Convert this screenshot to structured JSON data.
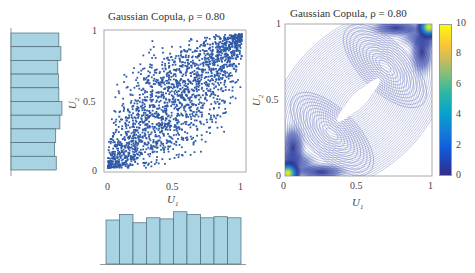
{
  "chart_data": [
    {
      "type": "scatter",
      "title": "Gaussian Copula, ρ = 0.80",
      "xlabel": "U1",
      "ylabel": "U2",
      "xlim": [
        0,
        1
      ],
      "ylim": [
        0,
        1
      ],
      "xticks": [
        "0",
        "0.5",
        "1"
      ],
      "yticks": [
        "0",
        "0.5",
        "1"
      ],
      "rho": 0.8,
      "n_points_approx": 2000,
      "point_color": "#2e5aa8",
      "grid": false
    },
    {
      "type": "heatmap",
      "subtype": "contour-density",
      "title": "Gaussian Copula, ρ = 0.80",
      "xlabel": "U1",
      "ylabel": "U2",
      "xlim": [
        0,
        1
      ],
      "ylim": [
        0,
        1
      ],
      "xticks": [
        "0",
        "0.5",
        "1"
      ],
      "yticks": [
        "0",
        "0.5",
        "1"
      ],
      "colorbar": {
        "min": 0,
        "max": 10,
        "ticks": [
          "0",
          "2",
          "4",
          "6",
          "8",
          "10"
        ],
        "colormap": "parula"
      },
      "rho": 0.8
    },
    {
      "type": "bar",
      "orientation": "horizontal",
      "description": "Marginal histogram of U2 (left)",
      "bins": 10,
      "values": [
        0.92,
        0.96,
        0.9,
        0.91,
        0.92,
        0.98,
        0.94,
        0.86,
        0.84,
        0.87
      ],
      "bar_color": "#a7d3e3"
    },
    {
      "type": "bar",
      "orientation": "vertical",
      "description": "Marginal histogram of U1 (bottom)",
      "bins": 10,
      "values": [
        0.8,
        0.9,
        0.75,
        0.84,
        0.82,
        0.95,
        0.9,
        0.84,
        0.86,
        0.84
      ],
      "bar_color": "#a7d3e3"
    }
  ],
  "scatter": {
    "title": "Gaussian Copula, ρ = 0.80",
    "xlabel_main": "U",
    "xlabel_sub": "1",
    "ylabel_main": "U",
    "ylabel_sub": "2",
    "xticks": [
      "0",
      "0.5",
      "1"
    ],
    "yticks": [
      "0",
      "0.5",
      "1"
    ]
  },
  "contour": {
    "title": "Gaussian Copula, ρ = 0.80",
    "xlabel_main": "U",
    "xlabel_sub": "1",
    "ylabel_main": "U",
    "ylabel_sub": "2",
    "xticks": [
      "0",
      "0.5",
      "1"
    ],
    "yticks": [
      "0",
      "0.5",
      "1"
    ],
    "colorbar_ticks": [
      "10",
      "8",
      "6",
      "4",
      "2",
      "0"
    ]
  }
}
